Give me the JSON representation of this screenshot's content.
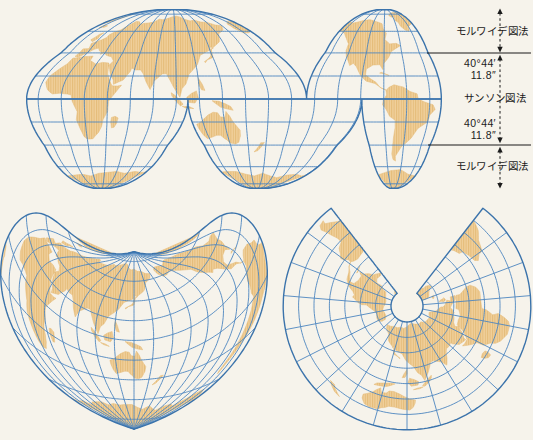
{
  "page": {
    "width": 533,
    "height": 440,
    "background": "#f6f3eb"
  },
  "palette": {
    "graticule": "#4d86c0",
    "outline": "#3b73ab",
    "land_base": "#f0d09b",
    "land_stripe": "#e4bb78",
    "annotation_ink": "#1b1b1b"
  },
  "annotation": {
    "top_projection_label": "モルワイデ図法",
    "middle_projection_label": "サンソン図法",
    "bottom_projection_label": "モルワイデ図法",
    "upper_latitude": {
      "degrees": "40°44′",
      "seconds": "11.8″"
    },
    "lower_latitude": {
      "degrees": "40°44′",
      "seconds": "11.8″"
    }
  },
  "maps": {
    "homolosine": {
      "grid_step_deg": 20,
      "cx": 234,
      "cy": 99,
      "radius_px": 66,
      "lon_offset_deg": 150,
      "lobes": [
        {
          "d0": -180,
          "d1": 63,
          "cm": -53,
          "south": false
        },
        {
          "d0": 63,
          "d1": 180,
          "cm": 131,
          "south": false
        },
        {
          "d0": -180,
          "d1": -40,
          "cm": -115,
          "south": true
        },
        {
          "d0": -40,
          "d1": 111,
          "cm": 20,
          "south": true
        },
        {
          "d0": 111,
          "d1": 180,
          "cm": 138,
          "south": true
        }
      ]
    },
    "bonne": {
      "grid_step_deg": 20,
      "apex_x": 134,
      "apex_y": 213,
      "radius_px": 56.5,
      "std_parallel_deg": 30,
      "central_meridian_deg": 140
    },
    "conic": {
      "grid_step_deg": 20,
      "cx": 407,
      "cy": 306,
      "hole_radius_px": 16,
      "px_per_deg": 0.77,
      "cone_constant": 0.79,
      "central_meridian_deg": 120,
      "lat_min_deg": -60,
      "lat_max_deg": 80
    }
  }
}
